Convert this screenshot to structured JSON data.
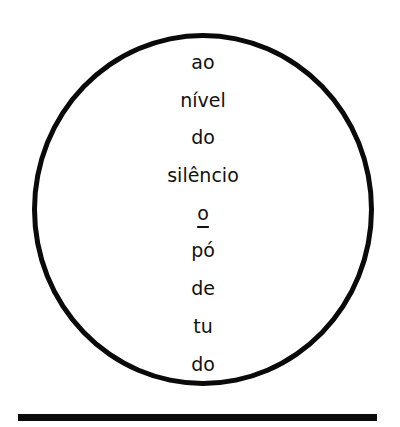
{
  "poem": {
    "lines": [
      "ao",
      "nível",
      "do",
      "silêncio",
      "o",
      "pó",
      "de",
      "tu",
      "do"
    ],
    "underlined_line_index": 4
  },
  "colors": {
    "ink": "#0a0a0a",
    "background": "#ffffff"
  }
}
